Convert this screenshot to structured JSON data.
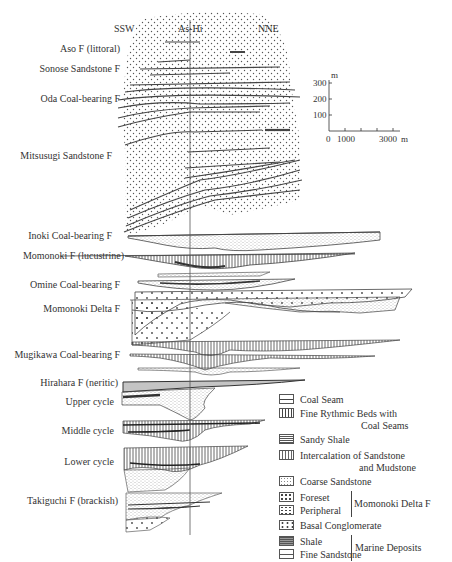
{
  "header": {
    "left_direction": "SSW",
    "well_label": "As-Hi",
    "right_direction": "NNE"
  },
  "formations": [
    {
      "label": "Aso F (littoral)",
      "y": 49
    },
    {
      "label": "Sonose Sandstone F",
      "y": 69
    },
    {
      "label": "Oda Coal-bearing F",
      "y": 99
    },
    {
      "label": "Mitsusugi Sandstone F",
      "y": 156
    },
    {
      "label": "Inoki Coal-bearing F",
      "y": 236
    },
    {
      "label": "Momonoki F (lucustrine)",
      "y": 256
    },
    {
      "label": "Omine Coal-bearing F",
      "y": 285
    },
    {
      "label": "Momonoki Delta F",
      "y": 309
    },
    {
      "label": "Mugikawa Coal-bearing F",
      "y": 355
    },
    {
      "label": "Hirahara F (neritic)",
      "y": 383
    },
    {
      "label": "Upper cycle",
      "y": 402
    },
    {
      "label": "Middle cycle",
      "y": 431
    },
    {
      "label": "Lower cycle",
      "y": 462
    },
    {
      "label": "Takiguchi F (brackish)",
      "y": 501
    }
  ],
  "scale_bar": {
    "vertical_unit": "m",
    "vertical_ticks": [
      "300",
      "200",
      "100"
    ],
    "horizontal_ticks": [
      "0",
      "1000",
      "3000"
    ],
    "horizontal_unit": "m"
  },
  "legend": {
    "items": [
      {
        "icon": "coal-seam-swatch",
        "label": "Coal Seam"
      },
      {
        "icon": "fine-rhythmic-swatch",
        "label": "Fine Rythmic Beds with",
        "label2": "Coal Seams"
      },
      {
        "icon": "sandy-shale-swatch",
        "label": "Sandy Shale"
      },
      {
        "icon": "intercalation-swatch",
        "label": "Intercalation of Sandstone",
        "label2": "and Mudstone"
      },
      {
        "icon": "coarse-sandstone-swatch",
        "label": "Coarse Sandstone"
      },
      {
        "icon": "foreset-swatch",
        "label": "Foreset"
      },
      {
        "icon": "peripheral-swatch",
        "label": "Peripheral"
      },
      {
        "icon": "basal-conglomerate-swatch",
        "label": "Basal Conglomerate"
      },
      {
        "icon": "shale-swatch",
        "label": "Shale"
      },
      {
        "icon": "fine-sandstone-swatch",
        "label": "Fine Sandstone"
      },
      {
        "icon": "neritic-sandstone-swatch",
        "label": "Neritic Sandstone"
      }
    ],
    "group_delta": "Momonoki Delta F",
    "group_marine": "Marine Deposits"
  }
}
